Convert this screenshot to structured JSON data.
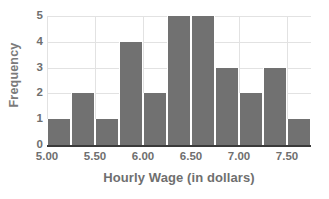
{
  "chart_data": {
    "type": "bar",
    "title": "",
    "xlabel": "Hourly Wage (in dollars)",
    "ylabel": "Frequency",
    "bin_width": 0.25,
    "bin_edges": [
      5.0,
      5.25,
      5.5,
      5.75,
      6.0,
      6.25,
      6.5,
      6.75,
      7.0,
      7.25,
      7.5,
      7.75
    ],
    "categories": [
      "5.00-5.25",
      "5.25-5.50",
      "5.50-5.75",
      "5.75-6.00",
      "6.00-6.25",
      "6.25-6.50",
      "6.50-6.75",
      "6.75-7.00",
      "7.00-7.25",
      "7.25-7.50",
      "7.50-7.75"
    ],
    "values": [
      1,
      2,
      1,
      4,
      2,
      5,
      5,
      3,
      2,
      3,
      1
    ],
    "xlim": [
      5.0,
      7.75
    ],
    "ylim": [
      0,
      5
    ],
    "xticks": [
      "5.00",
      "5.50",
      "6.00",
      "6.50",
      "7.00",
      "7.50"
    ],
    "xtick_values": [
      5.0,
      5.5,
      6.0,
      6.5,
      7.0,
      7.5
    ],
    "yticks": [
      "0",
      "1",
      "2",
      "3",
      "4",
      "5"
    ],
    "ytick_values": [
      0,
      1,
      2,
      3,
      4,
      5
    ],
    "grid": true,
    "legend": "none",
    "bar_color": "#717171",
    "grid_color": "#e2e2e2",
    "axis_color": "#3a3a3a",
    "text_color": "#6f6f6f"
  }
}
